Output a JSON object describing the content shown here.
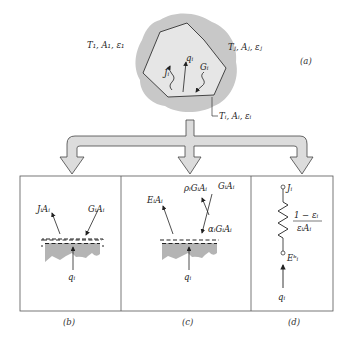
{
  "panel_a": {
    "caption": "(a)",
    "label_left": "T₁, A₁, ε₁",
    "label_right": "Tⱼ, Aⱼ, εⱼ",
    "label_bottom": "Tᵢ, Aᵢ, εᵢ",
    "arrow_J": "Jᵢ",
    "arrow_q": "qᵢ",
    "arrow_G": "Gᵢ"
  },
  "panel_b": {
    "caption": "(b)",
    "label_JA": "JᵢAᵢ",
    "label_GA": "GᵢAᵢ",
    "label_q": "qᵢ"
  },
  "panel_c": {
    "caption": "(c)",
    "label_EA": "EᵢAᵢ",
    "label_rhoGA": "ρᵢGᵢAᵢ",
    "label_GA": "GᵢAᵢ",
    "label_alphaGA": "αᵢGᵢAᵢ",
    "label_q": "qᵢ"
  },
  "panel_d": {
    "caption": "(d)",
    "label_J": "Jᵢ",
    "label_Eb": "Eᵇᵢ",
    "resistance_num": "1 − εᵢ",
    "resistance_den": "εᵢAᵢ",
    "label_q": "qᵢ"
  },
  "colors": {
    "surface_gray": "#b4b4b4",
    "blob_gray": "#c8c8c8",
    "arrow_fill": "#dcdcdc",
    "line": "#333333"
  }
}
